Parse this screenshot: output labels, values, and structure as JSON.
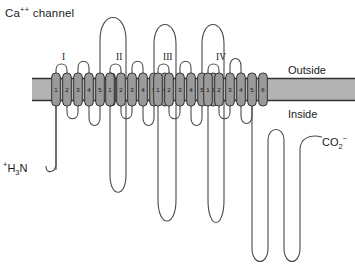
{
  "figure": {
    "title": "Ca++ channel",
    "title_base": "Ca",
    "title_sup": "++",
    "title_rest": " channel",
    "width": 355,
    "height": 264
  },
  "membrane": {
    "outside_label": "Outside",
    "inside_label": "Inside",
    "fill_color": "#b3b3b3",
    "border_color": "#333333",
    "left": 32,
    "right": 355,
    "top": 78,
    "bottom": 101
  },
  "termini": {
    "n_terminus": "+H3N",
    "n_terminus_sup": "+",
    "n_terminus_base": "H",
    "n_terminus_sub": "3",
    "n_terminus_tail": "N",
    "c_terminus": "CO2-",
    "c_terminus_base": "CO",
    "c_terminus_sub": "2",
    "c_terminus_sup": "−"
  },
  "domains": [
    {
      "numeral": "I",
      "label_x": 62,
      "label_y": 52,
      "start_x": 56,
      "segments": [
        "1",
        "2",
        "3",
        "4",
        "5",
        "6"
      ]
    },
    {
      "numeral": "II",
      "label_x": 116,
      "label_y": 52,
      "start_x": 110,
      "segments": [
        "1",
        "2",
        "3",
        "4",
        "5",
        "6"
      ]
    },
    {
      "numeral": "III",
      "label_x": 163,
      "label_y": 52,
      "start_x": 158,
      "segments": [
        "1",
        "2",
        "3",
        "4",
        "5",
        "6"
      ]
    },
    {
      "numeral": "IV",
      "label_x": 216,
      "label_y": 52,
      "start_x": 208,
      "segments": [
        "1",
        "2",
        "3",
        "4",
        "5",
        "6"
      ]
    }
  ],
  "colors": {
    "segment_fill": "#9a9a9a",
    "segment_stroke": "#333333",
    "chain_stroke": "#4a4a4a",
    "text": "#1a1a1a",
    "background": "#ffffff"
  },
  "legend": {
    "segment_note": "Six transmembrane segments numbered 1-6 per domain"
  }
}
